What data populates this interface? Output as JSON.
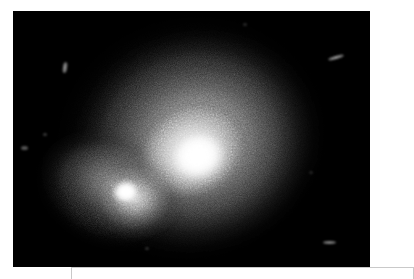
{
  "figure": {
    "kind": "astronomical-xray-image",
    "alt_description": "Grayscale X-ray image of an extended diffuse source with a bright central nucleus and a compact secondary source to the lower left",
    "caption": "",
    "background_color": "#000000",
    "page_color": "#ffffff"
  },
  "plate": {
    "left": 13,
    "top": 11,
    "width": 357,
    "height": 256
  },
  "caption_box": {
    "label": "",
    "border_color": "#c9c9c9"
  },
  "chart_data": {
    "type": "heatmap",
    "title": "",
    "subtitle": "",
    "xlabel": "",
    "ylabel": "",
    "colormap": "grayscale",
    "colormap_low": "#000000",
    "colormap_high": "#ffffff",
    "legend": [],
    "grid": false,
    "xlim": [
      0,
      357
    ],
    "ylim": [
      0,
      256
    ],
    "annotations": [],
    "sources": [
      {
        "name": "main-nucleus",
        "x": 185,
        "y": 145,
        "peak_brightness": 255,
        "radius": 33,
        "kind": "bright-core"
      },
      {
        "name": "secondary-companion",
        "x": 113,
        "y": 181,
        "peak_brightness": 255,
        "radius": 15,
        "kind": "compact-source"
      },
      {
        "name": "diffuse-halo",
        "x": 178,
        "y": 127,
        "peak_brightness": 205,
        "radius_major": 134,
        "radius_minor": 121,
        "position_angle": -14,
        "kind": "extended-emission"
      },
      {
        "name": "southwest-extension",
        "x": 97,
        "y": 179,
        "peak_brightness": 150,
        "radius_major": 75,
        "radius_minor": 59,
        "position_angle": 22,
        "kind": "tail"
      }
    ],
    "background_artifacts": [
      {
        "name": "streak-upper-right",
        "x": 322,
        "y": 48,
        "length": 14,
        "angle": -18
      },
      {
        "name": "streak-upper-left",
        "x": 65,
        "y": 66,
        "length": 9,
        "angle": 75
      },
      {
        "name": "streak-lower-right",
        "x": 328,
        "y": 242,
        "length": 11,
        "angle": 0
      },
      {
        "name": "point-source-left",
        "x": 24,
        "y": 147,
        "length": 5,
        "angle": 0
      },
      {
        "name": "point-source-left-upper",
        "x": 45,
        "y": 135,
        "length": 3,
        "angle": 0
      },
      {
        "name": "point-source-lower-mid",
        "x": 145,
        "y": 247,
        "length": 3,
        "angle": 0
      },
      {
        "name": "point-source-upper-mid",
        "x": 243,
        "y": 22,
        "length": 3,
        "angle": 0
      }
    ]
  }
}
